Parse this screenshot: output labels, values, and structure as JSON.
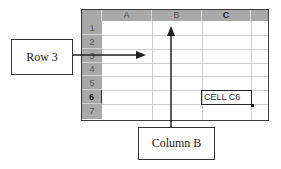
{
  "spreadsheet": {
    "columns": [
      {
        "label": "",
        "width": 21
      },
      {
        "label": "A",
        "width": 50
      },
      {
        "label": "B",
        "width": 50
      },
      {
        "label": "C",
        "width": 49
      },
      {
        "label": "",
        "width": 18
      }
    ],
    "rows": [
      "1",
      "2",
      "3",
      "4",
      "5",
      "6",
      "7"
    ],
    "selected_row": "6",
    "selected_column": "C",
    "active_cell": {
      "ref": "C6",
      "text": "CELL C6"
    }
  },
  "callouts": {
    "row": {
      "label": "Row 3",
      "points_to": "row 3"
    },
    "column": {
      "label": "Column B",
      "points_to": "column B"
    }
  },
  "colors": {
    "header_fill": "#a9a9a9",
    "grid_line": "#cfcfcf",
    "border": "#3a3a3a",
    "arrow": "#222222"
  }
}
